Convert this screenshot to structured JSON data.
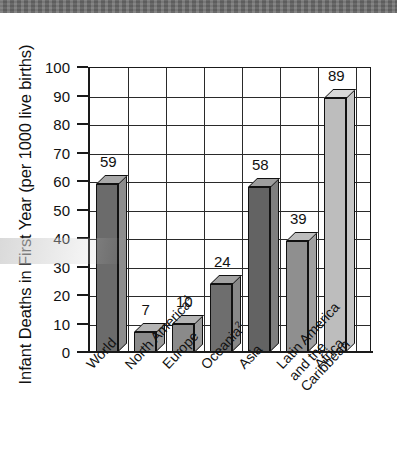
{
  "chart_data": {
    "type": "bar",
    "title": "",
    "xlabel": "",
    "ylabel": "Infant Deaths in First Year (per 1000 live births)",
    "ylim": [
      0,
      100
    ],
    "ytick_step": 10,
    "yticks": [
      "100",
      "90",
      "80",
      "70",
      "60",
      "50",
      "40",
      "30",
      "20",
      "10",
      "0"
    ],
    "grid": "horizontal-and-vertical",
    "legend": "none",
    "categories": [
      "World",
      "North America1",
      "Europe",
      "Oceania2",
      "Asia",
      "Latin America and the Caribbean",
      "Africa"
    ],
    "values": [
      59,
      7,
      10,
      24,
      58,
      39,
      89
    ],
    "bars": [
      {
        "category": "World",
        "label_lines": [
          "World"
        ],
        "superscript": "",
        "value": 59,
        "value_label": "59",
        "front_color": "#6b6b6b",
        "top_color": "#a8a8a8",
        "side_color": "#8d8d8d"
      },
      {
        "category": "North America",
        "label_lines": [
          "North America"
        ],
        "superscript": "1",
        "value": 7,
        "value_label": "7",
        "front_color": "#8a8a8a",
        "top_color": "#b4b4b4",
        "side_color": "#9b9b9b"
      },
      {
        "category": "Europe",
        "label_lines": [
          "Europe"
        ],
        "superscript": "",
        "value": 10,
        "value_label": "10",
        "front_color": "#8a8a8a",
        "top_color": "#b4b4b4",
        "side_color": "#9b9b9b"
      },
      {
        "category": "Oceania",
        "label_lines": [
          "Oceania"
        ],
        "superscript": "2",
        "value": 24,
        "value_label": "24",
        "front_color": "#6e6e6e",
        "top_color": "#a2a2a2",
        "side_color": "#888888"
      },
      {
        "category": "Asia",
        "label_lines": [
          "Asia"
        ],
        "superscript": "",
        "value": 58,
        "value_label": "58",
        "front_color": "#636363",
        "top_color": "#9e9e9e",
        "side_color": "#7f7f7f"
      },
      {
        "category": "Latin America and the Caribbean",
        "label_lines": [
          "Latin America",
          "and the",
          "Caribbean"
        ],
        "superscript": "",
        "value": 39,
        "value_label": "39",
        "front_color": "#8f8f8f",
        "top_color": "#bdbdbd",
        "side_color": "#a0a0a0"
      },
      {
        "category": "Africa",
        "label_lines": [
          "Africa"
        ],
        "superscript": "",
        "value": 89,
        "value_label": "89",
        "front_color": "#bdbdbd",
        "top_color": "#d8d8d8",
        "side_color": "#c6c6c6"
      }
    ]
  },
  "colors": {
    "axis": "#1a1a1a",
    "grid": "#2a2a2a",
    "text": "#111111",
    "background": "#ffffff",
    "scan_banner": "#6e6e6e"
  }
}
